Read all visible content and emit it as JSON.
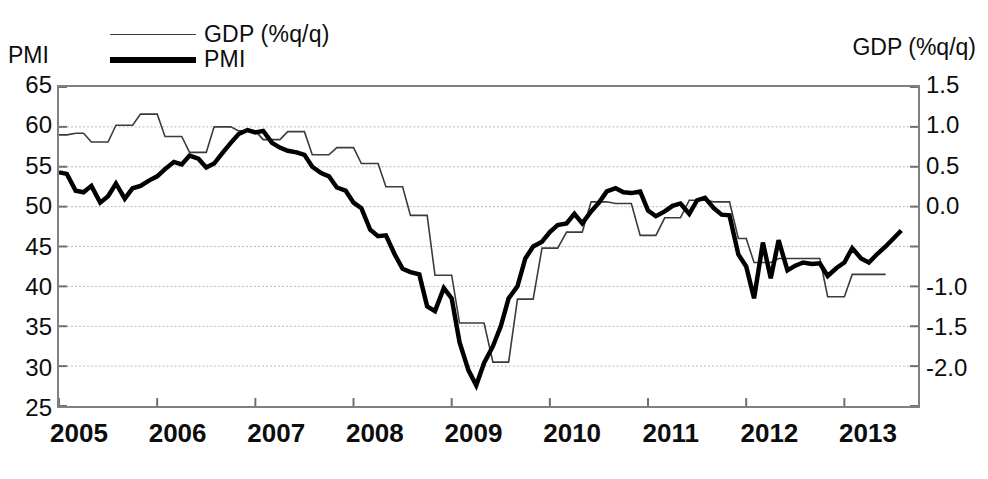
{
  "figure": {
    "title": "",
    "left_axis_caption": "PMI",
    "right_axis_caption": "GDP (%q/q)"
  },
  "legend": {
    "position": "top-left",
    "entries": [
      {
        "label": "GDP (%q/q)",
        "style": "thin-line",
        "color": "#3b3b3b"
      },
      {
        "label": "PMI",
        "style": "thick-line",
        "color": "#000000"
      }
    ]
  },
  "chart_data": {
    "type": "line",
    "title": "",
    "xlabel": "",
    "ylabel": "PMI",
    "y2label": "GDP (%q/q)",
    "grid": true,
    "legend_position": "top-left",
    "xlim": [
      2005.0,
      2013.75
    ],
    "xticks": [
      2005,
      2006,
      2007,
      2008,
      2009,
      2010,
      2011,
      2012,
      2013
    ],
    "xticklabels": [
      "2005",
      "2006",
      "2007",
      "2008",
      "2009",
      "2010",
      "2011",
      "2012",
      "2013"
    ],
    "ylim": [
      25,
      65
    ],
    "yticks": [
      25,
      30,
      35,
      40,
      45,
      50,
      55,
      60,
      65
    ],
    "yticklabels": [
      "25",
      "30",
      "35",
      "40",
      "45",
      "50",
      "55",
      "60",
      "65"
    ],
    "y2lim": [
      -2.0,
      1.5
    ],
    "y2ticks": [
      1.5,
      1.0,
      0.5,
      0.0,
      -0.5,
      -1.0,
      -1.5,
      -2.0
    ],
    "y2ticklabels": [
      "1.5",
      "1.0",
      "0.5",
      "0.0",
      "",
      "-1.0",
      "-1.5",
      "-2.0"
    ],
    "series": [
      {
        "name": "PMI",
        "axis": "left",
        "color": "#000000",
        "linewidth": 4.5,
        "x": [
          2005.0,
          2005.08,
          2005.17,
          2005.25,
          2005.33,
          2005.42,
          2005.5,
          2005.58,
          2005.67,
          2005.75,
          2005.83,
          2005.92,
          2006.0,
          2006.08,
          2006.17,
          2006.25,
          2006.33,
          2006.42,
          2006.5,
          2006.58,
          2006.67,
          2006.75,
          2006.83,
          2006.92,
          2007.0,
          2007.08,
          2007.17,
          2007.25,
          2007.33,
          2007.42,
          2007.5,
          2007.58,
          2007.67,
          2007.75,
          2007.83,
          2007.92,
          2008.0,
          2008.08,
          2008.17,
          2008.25,
          2008.33,
          2008.42,
          2008.5,
          2008.58,
          2008.67,
          2008.75,
          2008.83,
          2008.92,
          2009.0,
          2009.08,
          2009.17,
          2009.25,
          2009.33,
          2009.42,
          2009.5,
          2009.58,
          2009.67,
          2009.75,
          2009.83,
          2009.92,
          2010.0,
          2010.08,
          2010.17,
          2010.25,
          2010.33,
          2010.42,
          2010.5,
          2010.58,
          2010.67,
          2010.75,
          2010.83,
          2010.92,
          2011.0,
          2011.08,
          2011.17,
          2011.25,
          2011.33,
          2011.42,
          2011.5,
          2011.58,
          2011.67,
          2011.75,
          2011.83,
          2011.92,
          2012.0,
          2012.08,
          2012.17,
          2012.25,
          2012.33,
          2012.42,
          2012.5,
          2012.58,
          2012.67,
          2012.75,
          2012.83,
          2012.92,
          2013.0,
          2013.08,
          2013.17,
          2013.25,
          2013.33,
          2013.42,
          2013.5,
          2013.58
        ],
        "values": [
          54.3,
          54.1,
          52.0,
          51.8,
          52.6,
          50.5,
          51.3,
          52.9,
          51.0,
          52.3,
          52.6,
          53.3,
          53.8,
          54.7,
          55.6,
          55.3,
          56.4,
          56.0,
          54.9,
          55.4,
          56.8,
          58.0,
          59.1,
          59.6,
          59.3,
          59.5,
          58.0,
          57.4,
          57.0,
          56.8,
          56.5,
          55.0,
          54.2,
          53.8,
          52.4,
          52.0,
          50.5,
          49.8,
          47.1,
          46.3,
          46.4,
          44.0,
          42.2,
          41.8,
          41.5,
          37.5,
          36.9,
          39.8,
          38.5,
          33.0,
          29.5,
          27.6,
          30.4,
          32.5,
          35.0,
          38.5,
          40.0,
          43.5,
          45.0,
          45.6,
          46.8,
          47.7,
          47.9,
          49.1,
          47.9,
          49.4,
          50.5,
          51.9,
          52.3,
          51.8,
          51.7,
          51.9,
          49.5,
          48.8,
          49.4,
          50.1,
          50.4,
          49.1,
          50.8,
          51.1,
          49.8,
          49.0,
          48.9,
          44.0,
          42.5,
          38.5,
          45.5,
          41.0,
          45.8,
          42.0,
          42.6,
          43.0,
          42.8,
          42.9,
          41.3,
          42.3,
          43.0,
          44.8,
          43.5,
          43.0,
          44.0,
          45.0,
          46.0,
          47.0
        ]
      },
      {
        "name": "GDP (%q/q)",
        "axis": "right",
        "color": "#3b3b3b",
        "linewidth": 1.6,
        "x": [
          2005.0,
          2005.08,
          2005.17,
          2005.25,
          2005.33,
          2005.42,
          2005.5,
          2005.58,
          2005.67,
          2005.75,
          2005.83,
          2005.92,
          2006.0,
          2006.08,
          2006.17,
          2006.25,
          2006.33,
          2006.42,
          2006.5,
          2006.58,
          2006.67,
          2006.75,
          2006.83,
          2006.92,
          2007.0,
          2007.08,
          2007.17,
          2007.25,
          2007.33,
          2007.42,
          2007.5,
          2007.58,
          2007.67,
          2007.75,
          2007.83,
          2007.92,
          2008.0,
          2008.08,
          2008.17,
          2008.25,
          2008.33,
          2008.42,
          2008.5,
          2008.58,
          2008.67,
          2008.75,
          2008.83,
          2008.92,
          2009.0,
          2009.08,
          2009.17,
          2009.25,
          2009.33,
          2009.42,
          2009.5,
          2009.58,
          2009.67,
          2009.75,
          2009.83,
          2009.92,
          2010.0,
          2010.08,
          2010.17,
          2010.25,
          2010.33,
          2010.42,
          2010.5,
          2010.58,
          2010.67,
          2010.75,
          2010.83,
          2010.92,
          2011.0,
          2011.08,
          2011.17,
          2011.25,
          2011.33,
          2011.42,
          2011.5,
          2011.58,
          2011.67,
          2011.75,
          2011.83,
          2011.92,
          2012.0,
          2012.08,
          2012.17,
          2012.25,
          2012.33,
          2012.42,
          2012.5,
          2012.58,
          2012.67,
          2012.75,
          2012.83,
          2012.92,
          2013.0,
          2013.08,
          2013.17,
          2013.25,
          2013.33,
          2013.42
        ],
        "values_pmi_scale": [
          59.0,
          59.0,
          59.2,
          59.2,
          58.1,
          58.1,
          58.1,
          60.2,
          60.2,
          60.2,
          61.6,
          61.6,
          61.6,
          58.8,
          58.8,
          58.8,
          56.8,
          56.8,
          56.8,
          60.0,
          60.0,
          60.0,
          59.5,
          59.5,
          59.5,
          58.4,
          58.4,
          58.4,
          59.4,
          59.4,
          59.4,
          56.5,
          56.5,
          56.5,
          57.4,
          57.4,
          57.4,
          55.4,
          55.4,
          55.4,
          52.5,
          52.5,
          52.5,
          48.9,
          48.9,
          48.9,
          41.4,
          41.4,
          41.4,
          35.4,
          35.4,
          35.4,
          35.4,
          30.5,
          30.5,
          30.5,
          38.4,
          38.4,
          38.4,
          44.8,
          44.8,
          44.8,
          46.8,
          46.8,
          46.8,
          50.6,
          50.6,
          50.6,
          50.4,
          50.4,
          50.4,
          46.4,
          46.4,
          46.4,
          48.6,
          48.6,
          48.6,
          50.8,
          50.8,
          50.8,
          50.6,
          50.6,
          50.6,
          46.0,
          46.0,
          43.0,
          43.0,
          43.0,
          43.5,
          43.5,
          43.5,
          43.5,
          43.5,
          43.5,
          38.7,
          38.7,
          38.7,
          41.5,
          41.5,
          41.5,
          41.5,
          41.5
        ],
        "values": [
          1.01,
          1.01,
          1.03,
          1.03,
          0.93,
          0.93,
          0.93,
          1.11,
          1.11,
          1.11,
          1.24,
          1.24,
          1.24,
          0.99,
          0.99,
          0.99,
          0.81,
          0.81,
          0.81,
          1.09,
          1.09,
          1.09,
          1.04,
          1.04,
          1.04,
          0.95,
          0.95,
          0.95,
          1.03,
          1.03,
          1.03,
          0.78,
          0.78,
          0.78,
          0.85,
          0.85,
          0.85,
          0.68,
          0.68,
          0.68,
          0.43,
          0.43,
          0.43,
          0.12,
          0.12,
          0.12,
          -0.54,
          -0.54,
          -0.54,
          -1.06,
          -1.06,
          -1.06,
          -1.06,
          -1.49,
          -1.49,
          -1.49,
          -0.8,
          -0.8,
          -0.8,
          -0.24,
          -0.24,
          -0.24,
          -0.06,
          -0.06,
          -0.06,
          0.27,
          0.27,
          0.27,
          0.25,
          0.25,
          0.25,
          -0.11,
          -0.11,
          -0.11,
          0.08,
          0.08,
          0.08,
          0.28,
          0.28,
          0.28,
          0.27,
          0.27,
          0.27,
          -0.14,
          -0.14,
          -0.4,
          -0.4,
          -0.4,
          -0.36,
          -0.36,
          -0.36,
          -0.36,
          -0.36,
          -0.36,
          -0.78,
          -0.78,
          -0.78,
          -0.53,
          -0.53,
          -0.53,
          -0.53,
          -0.53
        ]
      }
    ]
  }
}
